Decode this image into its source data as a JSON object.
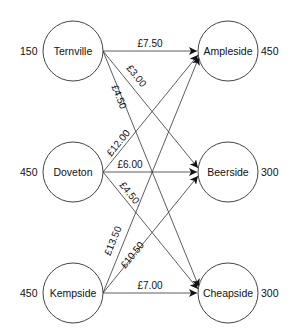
{
  "diagram": {
    "type": "transportation-network",
    "sources": [
      {
        "name": "Ternville",
        "supply": "150",
        "cx": 73,
        "cy": 51
      },
      {
        "name": "Doveton",
        "supply": "450",
        "cx": 73,
        "cy": 172
      },
      {
        "name": "Kempside",
        "supply": "450",
        "cx": 73,
        "cy": 293
      }
    ],
    "destinations": [
      {
        "name": "Ampleside",
        "demand": "450",
        "cx": 228,
        "cy": 51
      },
      {
        "name": "Beerside",
        "demand": "300",
        "cx": 228,
        "cy": 172
      },
      {
        "name": "Cheapside",
        "demand": "300",
        "cx": 228,
        "cy": 293
      }
    ],
    "node_radius": 30,
    "edges": [
      {
        "from": "Ternville",
        "to": "Ampleside",
        "cost": "£7.50",
        "x1": 103,
        "y1": 51,
        "x2": 197,
        "y2": 51,
        "lx": 150,
        "ly": 46,
        "angle": 0
      },
      {
        "from": "Ternville",
        "to": "Beerside",
        "cost": "£3.00",
        "x1": 103,
        "y1": 51,
        "x2": 197,
        "y2": 169,
        "lx": 132,
        "ly": 76,
        "angle": 51
      },
      {
        "from": "Ternville",
        "to": "Cheapside",
        "cost": "£4.50",
        "x1": 103,
        "y1": 51,
        "x2": 198,
        "y2": 288,
        "lx": 115,
        "ly": 95,
        "angle": 68
      },
      {
        "from": "Doveton",
        "to": "Ampleside",
        "cost": "£12.00",
        "x1": 103,
        "y1": 172,
        "x2": 197,
        "y2": 57,
        "lx": 120,
        "ly": 145,
        "angle": -51
      },
      {
        "from": "Doveton",
        "to": "Beerside",
        "cost": "£6.00",
        "x1": 103,
        "y1": 172,
        "x2": 197,
        "y2": 172,
        "lx": 130,
        "ly": 167,
        "angle": 0
      },
      {
        "from": "Doveton",
        "to": "Cheapside",
        "cost": "£4.50",
        "x1": 103,
        "y1": 172,
        "x2": 197,
        "y2": 287,
        "lx": 124,
        "ly": 194,
        "angle": 51
      },
      {
        "from": "Kempside",
        "to": "Ampleside",
        "cost": "£13.50",
        "x1": 103,
        "y1": 293,
        "x2": 198,
        "y2": 57,
        "lx": 115,
        "ly": 243,
        "angle": -68
      },
      {
        "from": "Kempside",
        "to": "Beerside",
        "cost": "£10.50",
        "x1": 103,
        "y1": 293,
        "x2": 197,
        "y2": 176,
        "lx": 133,
        "ly": 257,
        "angle": -51
      },
      {
        "from": "Kempside",
        "to": "Cheapside",
        "cost": "£7.00",
        "x1": 103,
        "y1": 293,
        "x2": 197,
        "y2": 293,
        "lx": 150,
        "ly": 288,
        "angle": 0
      }
    ]
  },
  "labels": {
    "ternville": "Ternville",
    "doveton": "Doveton",
    "kempside": "Kempside",
    "ampleside": "Ampleside",
    "beerside": "Beerside",
    "cheapside": "Cheapside",
    "ternville_supply": "150",
    "doveton_supply": "450",
    "kempside_supply": "450",
    "ampleside_demand": "450",
    "beerside_demand": "300",
    "cheapside_demand": "300",
    "cost_t_a": "£7.50",
    "cost_t_b": "£3.00",
    "cost_t_c": "£4.50",
    "cost_d_a": "£12.00",
    "cost_d_b": "£6.00",
    "cost_d_c": "£4.50",
    "cost_k_a": "£13.50",
    "cost_k_b": "£10.50",
    "cost_k_c": "£7.00"
  }
}
